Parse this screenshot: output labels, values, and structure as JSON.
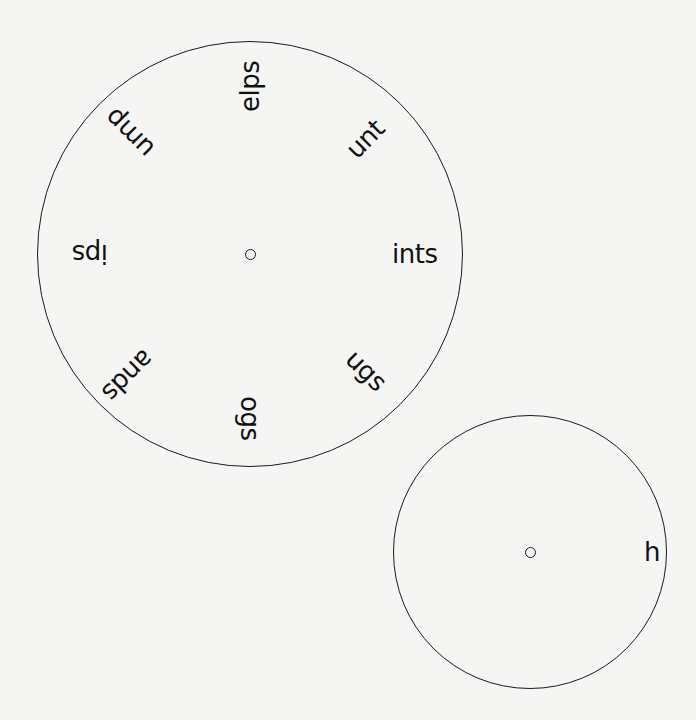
{
  "diagram": {
    "background": "#f5f5f4",
    "stroke_color": "#1a1a1a",
    "wheels": [
      {
        "id": "large",
        "center": [
          250,
          254
        ],
        "radius": 213,
        "hub_radius": 5.5,
        "label_inner_radius": 142,
        "labels": [
          {
            "text": "ints",
            "angle_deg": 0
          },
          {
            "text": "unt",
            "angle_deg": -45
          },
          {
            "text": "elps",
            "angle_deg": -90
          },
          {
            "text": "ump",
            "angle_deg": -135
          },
          {
            "text": "ips",
            "angle_deg": 180
          },
          {
            "text": "ands",
            "angle_deg": 135
          },
          {
            "text": "ogs",
            "angle_deg": 90
          },
          {
            "text": "ugs",
            "angle_deg": 45
          }
        ]
      },
      {
        "id": "small",
        "center": [
          530,
          552
        ],
        "radius": 137,
        "hub_radius": 5.5,
        "label_inner_radius": 114,
        "labels": [
          {
            "text": "h",
            "angle_deg": 0
          }
        ]
      }
    ]
  }
}
